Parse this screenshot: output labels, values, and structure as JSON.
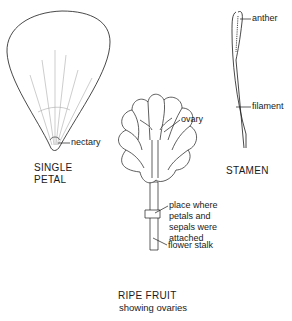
{
  "diagram": {
    "panels": [
      {
        "id": "single-petal",
        "caption_line1": "SINGLE",
        "caption_line2": "PETAL",
        "labels": [
          {
            "text": "nectary"
          }
        ]
      },
      {
        "id": "stamen",
        "caption": "STAMEN",
        "labels": [
          {
            "text": "anther"
          },
          {
            "text": "filament"
          }
        ]
      },
      {
        "id": "ripe-fruit",
        "caption_title": "RIPE FRUIT",
        "caption_subtitle": "showing ovaries",
        "labels": [
          {
            "text": "ovary"
          },
          {
            "text": "place where\npetals and\nsepals were\nattached"
          },
          {
            "text": "flower stalk"
          }
        ]
      }
    ],
    "colors": {
      "line": "#1a1a1a",
      "faint": "#9a9a9a",
      "background": "#ffffff"
    }
  }
}
